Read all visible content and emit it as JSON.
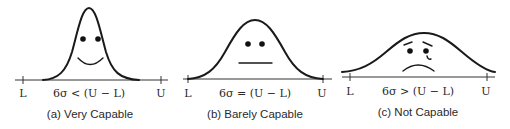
{
  "figure": {
    "panels": [
      {
        "id": "a",
        "caption": "(a) Very Capable",
        "lower_label": "L",
        "upper_label": "U",
        "relation": "6σ < (U − L)",
        "face": "smile"
      },
      {
        "id": "b",
        "caption": "(b) Barely Capable",
        "lower_label": "L",
        "upper_label": "U",
        "relation": "6σ = (U − L)",
        "face": "neutral"
      },
      {
        "id": "c",
        "caption": "(c) Not Capable",
        "lower_label": "L",
        "upper_label": "U",
        "relation": "6σ > (U − L)",
        "face": "sad-with-tear"
      }
    ]
  }
}
